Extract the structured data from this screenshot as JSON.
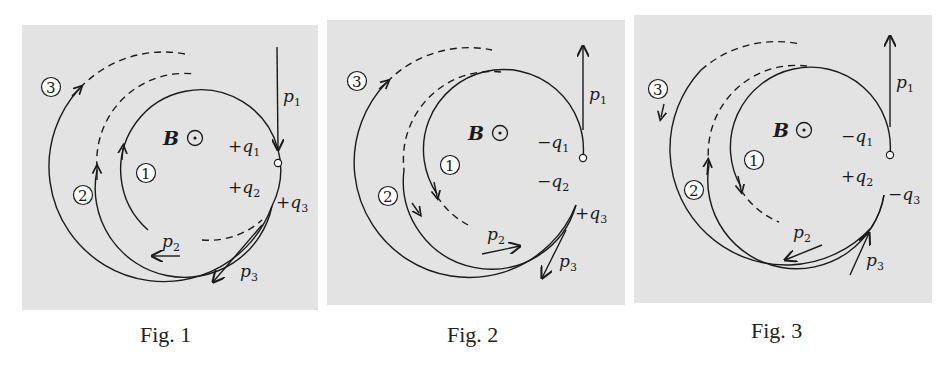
{
  "figures": [
    {
      "caption": "Fig. 1",
      "field": "B",
      "labels": {
        "p1": "p",
        "p1_sub": "1",
        "p2": "p",
        "p2_sub": "2",
        "p3": "p",
        "p3_sub": "3",
        "q1_sign": "+",
        "q1": "q",
        "q1_sub": "1",
        "q2_sign": "+",
        "q2": "q",
        "q2_sub": "2",
        "q3_sign": "+",
        "q3": "q",
        "q3_sub": "3"
      },
      "track_numbers": [
        "1",
        "2",
        "3"
      ]
    },
    {
      "caption": "Fig. 2",
      "field": "B",
      "labels": {
        "p1": "p",
        "p1_sub": "1",
        "p2": "p",
        "p2_sub": "2",
        "p3": "p",
        "p3_sub": "3",
        "q1_sign": "−",
        "q1": "q",
        "q1_sub": "1",
        "q2_sign": "−",
        "q2": "q",
        "q2_sub": "2",
        "q3_sign": "+",
        "q3": "q",
        "q3_sub": "3"
      },
      "track_numbers": [
        "1",
        "2",
        "3"
      ]
    },
    {
      "caption": "Fig. 3",
      "field": "B",
      "labels": {
        "p1": "p",
        "p1_sub": "1",
        "p2": "p",
        "p2_sub": "2",
        "p3": "p",
        "p3_sub": "3",
        "q1_sign": "−",
        "q1": "q",
        "q1_sub": "1",
        "q2_sign": "+",
        "q2": "q",
        "q2_sub": "2",
        "q3_sign": "−",
        "q3": "q",
        "q3_sub": "3"
      },
      "track_numbers": [
        "1",
        "2",
        "3"
      ]
    }
  ],
  "colors": {
    "panel_bg": "#e3e3e3",
    "stroke": "#1a1a1a",
    "page_bg": "#ffffff"
  }
}
